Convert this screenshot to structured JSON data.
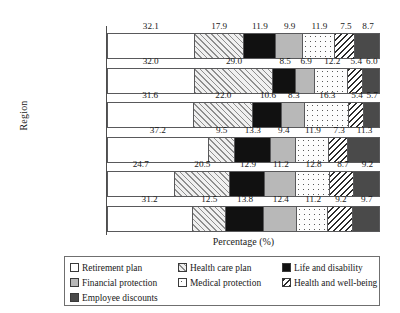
{
  "chart_data": {
    "type": "bar",
    "orientation": "horizontal",
    "stacked": true,
    "title": "",
    "xlabel": "Percentage (%)",
    "ylabel": "Region",
    "xlim": [
      0,
      100
    ],
    "grid": false,
    "legend_position": "bottom",
    "categories": [
      "Global",
      "US",
      "Canada",
      "Europe",
      "Latin America",
      "Asia Pacific"
    ],
    "series": [
      {
        "name": "Retirement plan",
        "pattern": "solid-white",
        "color": "#ffffff",
        "values": [
          32.1,
          32.0,
          31.6,
          37.2,
          24.7,
          31.2
        ]
      },
      {
        "name": "Health care plan",
        "pattern": "forward-hatch",
        "color": "#f0f0f0",
        "values": [
          17.9,
          29.0,
          22.0,
          9.5,
          20.5,
          12.5
        ]
      },
      {
        "name": "Life and disability",
        "pattern": "solid-black",
        "color": "#111111",
        "values": [
          11.9,
          8.5,
          10.6,
          13.3,
          12.9,
          13.8
        ]
      },
      {
        "name": "Financial protection",
        "pattern": "solid-gray",
        "color": "#b8b8b8",
        "values": [
          9.9,
          6.9,
          8.3,
          9.4,
          11.2,
          12.4
        ]
      },
      {
        "name": "Medical protection",
        "pattern": "dotted",
        "color": "#fdfdfd",
        "values": [
          11.9,
          12.2,
          16.3,
          11.9,
          12.8,
          11.2
        ]
      },
      {
        "name": "Health and well-being",
        "pattern": "backward-hatch",
        "color": "#ffffff",
        "values": [
          7.5,
          5.4,
          5.4,
          7.3,
          8.7,
          9.2
        ]
      },
      {
        "name": "Employee discounts",
        "pattern": "solid-dark-gray",
        "color": "#4a4a4a",
        "values": [
          8.7,
          6.0,
          5.7,
          11.3,
          9.2,
          9.7
        ]
      }
    ]
  },
  "legend": {
    "items": [
      {
        "label": "Retirement plan",
        "swatch": "retirement"
      },
      {
        "label": "Health care plan",
        "swatch": "healthcare"
      },
      {
        "label": "Life and disability",
        "swatch": "life"
      },
      {
        "label": "Financial protection",
        "swatch": "financial"
      },
      {
        "label": "Medical protection",
        "swatch": "medical"
      },
      {
        "label": "Health and well-being",
        "swatch": "wellbeing"
      },
      {
        "label": "Employee discounts",
        "swatch": "discounts"
      }
    ]
  }
}
